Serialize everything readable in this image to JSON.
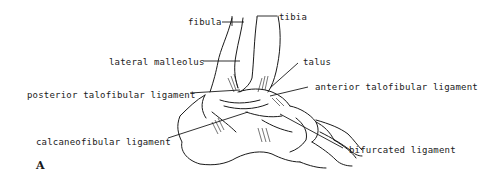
{
  "figure": {
    "panel_letter": "A",
    "labels": {
      "fibula": "fibula",
      "tibia": "tibia",
      "lateral_malleolus": "lateral malleolus",
      "talus": "talus",
      "posterior_talofibular_ligament": "posterior talofibular ligament",
      "anterior_talofibular_ligament": "anterior talofibular ligament",
      "calcaneofibular_ligament": "calcaneofibular ligament",
      "bifurcated_ligament": "bifurcated ligament"
    },
    "colors": {
      "ink": "#1a1a1a",
      "background": "#ffffff"
    }
  }
}
